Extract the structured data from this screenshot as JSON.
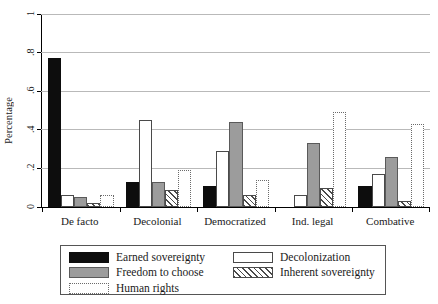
{
  "chart_data": {
    "type": "bar",
    "title": "",
    "xlabel": "",
    "ylabel": "Percentage",
    "ylim": [
      0,
      1
    ],
    "yticks": [
      "0",
      ".2",
      ".4",
      ".6",
      ".8",
      "1"
    ],
    "ytick_values": [
      0,
      0.2,
      0.4,
      0.6,
      0.8,
      1
    ],
    "grid": "horizontal",
    "legend_position": "below-plot",
    "categories": [
      "De facto",
      "Decolonial",
      "Democratized",
      "Ind. legal",
      "Combative"
    ],
    "series": [
      {
        "name": "Earned sovereignty",
        "style": "black",
        "values": [
          0.77,
          0.13,
          0.11,
          0.0,
          0.11
        ]
      },
      {
        "name": "Decolonization",
        "style": "white",
        "values": [
          0.06,
          0.45,
          0.29,
          0.06,
          0.17
        ]
      },
      {
        "name": "Freedom to choose",
        "style": "gray",
        "values": [
          0.05,
          0.13,
          0.44,
          0.33,
          0.26
        ]
      },
      {
        "name": "Inherent sovereignty",
        "style": "hatch",
        "values": [
          0.02,
          0.09,
          0.06,
          0.1,
          0.03
        ]
      },
      {
        "name": "Human rights",
        "style": "dot",
        "values": [
          0.06,
          0.19,
          0.14,
          0.49,
          0.43
        ]
      }
    ]
  },
  "legend": {
    "entries": [
      {
        "label": "Earned sovereignty",
        "style": "black"
      },
      {
        "label": "Freedom to choose",
        "style": "gray"
      },
      {
        "label": "Human rights",
        "style": "dot"
      },
      {
        "label": "Decolonization",
        "style": "white"
      },
      {
        "label": "Inherent sovereignty",
        "style": "hatch"
      }
    ]
  },
  "colors": {
    "black": "#0d0d0d",
    "gray": "#9c9c9c",
    "white": "#ffffff",
    "outline": "#4a4a4a",
    "grid": "#b9b9b9",
    "axis": "#000000"
  }
}
